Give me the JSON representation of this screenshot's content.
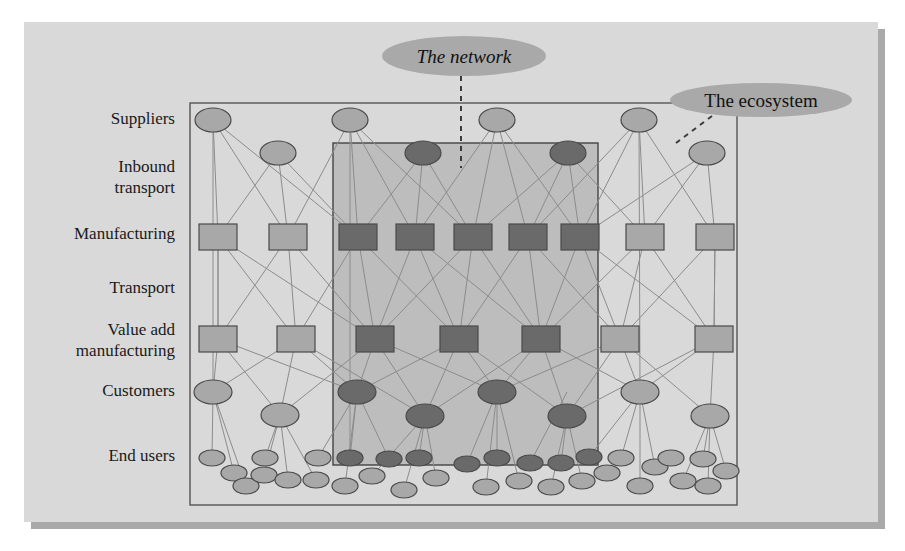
{
  "figure": {
    "kind": "network-ecosystem-diagram",
    "page_background": "#ffffff",
    "panel": {
      "x": 24,
      "y": 22,
      "w": 854,
      "h": 500,
      "fill": "#d9d9d9",
      "shadow": "#a9a9a9",
      "shadow_offset": 7
    },
    "outer_box": {
      "x": 190,
      "y": 103,
      "w": 547,
      "h": 402,
      "stroke": "#555555",
      "fill": "none",
      "label": "The ecosystem"
    },
    "inner_box": {
      "x": 333,
      "y": 143,
      "w": 265,
      "h": 322,
      "stroke": "#444444",
      "fill": "#bdbdbd",
      "label": "The network"
    }
  },
  "colors": {
    "light_node": "#a8a8a8",
    "dark_node": "#6a6a6a",
    "node_stroke": "#4a4a4a",
    "edge": "#8c8c8c",
    "callout_fill": "#a9a9a9",
    "panel_fill": "#d9d9d9",
    "inner_fill": "#bdbdbd",
    "text": "#111111"
  },
  "row_labels": [
    {
      "id": "suppliers",
      "lines": [
        "Suppliers"
      ],
      "x": 175,
      "y": 124
    },
    {
      "id": "inbound-transport",
      "lines": [
        "Inbound",
        "transport"
      ],
      "x": 175,
      "y": 172
    },
    {
      "id": "manufacturing",
      "lines": [
        "Manufacturing"
      ],
      "x": 175,
      "y": 239
    },
    {
      "id": "transport",
      "lines": [
        "Transport"
      ],
      "x": 175,
      "y": 293
    },
    {
      "id": "value-add-manufacturing",
      "lines": [
        "Value add",
        "manufacturing"
      ],
      "x": 175,
      "y": 335
    },
    {
      "id": "customers",
      "lines": [
        "Customers"
      ],
      "x": 175,
      "y": 396
    },
    {
      "id": "end-users",
      "lines": [
        "End users"
      ],
      "x": 175,
      "y": 461
    }
  ],
  "callouts": [
    {
      "id": "the-network",
      "text": "The network",
      "italic": true,
      "ellipse": {
        "cx": 464,
        "cy": 56,
        "rx": 82,
        "ry": 20
      },
      "leader": {
        "type": "dashed-vertical",
        "x1": 461,
        "y1": 76,
        "x2": 461,
        "y2": 168
      }
    },
    {
      "id": "the-ecosystem",
      "text": "The ecosystem",
      "italic": false,
      "ellipse": {
        "cx": 761,
        "cy": 100,
        "rx": 91,
        "ry": 17
      },
      "leader": {
        "type": "dashed-diagonal",
        "x1": 712,
        "y1": 116,
        "x2": 676,
        "y2": 143
      }
    }
  ],
  "rows": {
    "suppliers": {
      "shape": "ellipse",
      "rx": 18,
      "ry": 12,
      "cy": 120,
      "nodes": [
        {
          "cx": 213,
          "tone": "light"
        },
        {
          "cx": 350,
          "tone": "light"
        },
        {
          "cx": 497,
          "tone": "light"
        },
        {
          "cx": 639,
          "tone": "light"
        }
      ]
    },
    "inbound_transport": {
      "shape": "ellipse",
      "rx": 18,
      "ry": 12,
      "cy": 153,
      "nodes": [
        {
          "cx": 278,
          "tone": "light"
        },
        {
          "cx": 423,
          "tone": "dark"
        },
        {
          "cx": 568,
          "tone": "dark"
        },
        {
          "cx": 707,
          "tone": "light"
        }
      ]
    },
    "manufacturing": {
      "shape": "rect",
      "w": 38,
      "h": 26,
      "cy": 237,
      "nodes": [
        {
          "cx": 218,
          "tone": "light"
        },
        {
          "cx": 288,
          "tone": "light"
        },
        {
          "cx": 358,
          "tone": "dark"
        },
        {
          "cx": 415,
          "tone": "dark"
        },
        {
          "cx": 473,
          "tone": "dark"
        },
        {
          "cx": 528,
          "tone": "dark"
        },
        {
          "cx": 580,
          "tone": "dark"
        },
        {
          "cx": 645,
          "tone": "light"
        },
        {
          "cx": 715,
          "tone": "light"
        }
      ]
    },
    "value_add": {
      "shape": "rect",
      "w": 38,
      "h": 26,
      "cy": 339,
      "nodes": [
        {
          "cx": 218,
          "tone": "light"
        },
        {
          "cx": 296,
          "tone": "light"
        },
        {
          "cx": 375,
          "tone": "dark"
        },
        {
          "cx": 459,
          "tone": "dark"
        },
        {
          "cx": 541,
          "tone": "dark"
        },
        {
          "cx": 620,
          "tone": "light"
        },
        {
          "cx": 714,
          "tone": "light"
        }
      ]
    },
    "customers": {
      "shape": "ellipse",
      "rx": 19,
      "ry": 12,
      "nodes": [
        {
          "cx": 213,
          "cy": 392,
          "tone": "light"
        },
        {
          "cx": 280,
          "cy": 415,
          "tone": "light"
        },
        {
          "cx": 357,
          "cy": 392,
          "tone": "dark"
        },
        {
          "cx": 425,
          "cy": 416,
          "tone": "dark"
        },
        {
          "cx": 497,
          "cy": 392,
          "tone": "dark"
        },
        {
          "cx": 567,
          "cy": 416,
          "tone": "dark"
        },
        {
          "cx": 640,
          "cy": 392,
          "tone": "light"
        },
        {
          "cx": 710,
          "cy": 416,
          "tone": "light"
        }
      ]
    },
    "end_users": {
      "shape": "ellipse",
      "rx": 13,
      "ry": 8,
      "nodes": [
        {
          "cx": 212,
          "cy": 458,
          "tone": "light"
        },
        {
          "cx": 234,
          "cy": 473,
          "tone": "light"
        },
        {
          "cx": 246,
          "cy": 486,
          "tone": "light"
        },
        {
          "cx": 264,
          "cy": 475,
          "tone": "light"
        },
        {
          "cx": 265,
          "cy": 458,
          "tone": "light"
        },
        {
          "cx": 288,
          "cy": 480,
          "tone": "light"
        },
        {
          "cx": 316,
          "cy": 480,
          "tone": "light"
        },
        {
          "cx": 318,
          "cy": 458,
          "tone": "light"
        },
        {
          "cx": 345,
          "cy": 486,
          "tone": "light"
        },
        {
          "cx": 350,
          "cy": 458,
          "tone": "dark"
        },
        {
          "cx": 372,
          "cy": 476,
          "tone": "light"
        },
        {
          "cx": 389,
          "cy": 459,
          "tone": "dark"
        },
        {
          "cx": 404,
          "cy": 490,
          "tone": "light"
        },
        {
          "cx": 419,
          "cy": 458,
          "tone": "dark"
        },
        {
          "cx": 436,
          "cy": 478,
          "tone": "light"
        },
        {
          "cx": 467,
          "cy": 464,
          "tone": "dark"
        },
        {
          "cx": 486,
          "cy": 487,
          "tone": "light"
        },
        {
          "cx": 497,
          "cy": 458,
          "tone": "dark"
        },
        {
          "cx": 519,
          "cy": 481,
          "tone": "light"
        },
        {
          "cx": 530,
          "cy": 463,
          "tone": "dark"
        },
        {
          "cx": 551,
          "cy": 487,
          "tone": "light"
        },
        {
          "cx": 561,
          "cy": 463,
          "tone": "dark"
        },
        {
          "cx": 582,
          "cy": 481,
          "tone": "light"
        },
        {
          "cx": 589,
          "cy": 457,
          "tone": "dark"
        },
        {
          "cx": 607,
          "cy": 473,
          "tone": "light"
        },
        {
          "cx": 621,
          "cy": 458,
          "tone": "light"
        },
        {
          "cx": 640,
          "cy": 486,
          "tone": "light"
        },
        {
          "cx": 655,
          "cy": 467,
          "tone": "light"
        },
        {
          "cx": 671,
          "cy": 458,
          "tone": "light"
        },
        {
          "cx": 683,
          "cy": 481,
          "tone": "light"
        },
        {
          "cx": 703,
          "cy": 459,
          "tone": "light"
        },
        {
          "cx": 708,
          "cy": 486,
          "tone": "light"
        },
        {
          "cx": 726,
          "cy": 471,
          "tone": "light"
        }
      ]
    }
  },
  "edges": [
    [
      213,
      120,
      218,
      237
    ],
    [
      213,
      120,
      288,
      237
    ],
    [
      213,
      120,
      358,
      237
    ],
    [
      350,
      120,
      288,
      237
    ],
    [
      350,
      120,
      358,
      237
    ],
    [
      350,
      120,
      415,
      237
    ],
    [
      350,
      120,
      473,
      237
    ],
    [
      497,
      120,
      415,
      237
    ],
    [
      497,
      120,
      473,
      237
    ],
    [
      497,
      120,
      528,
      237
    ],
    [
      497,
      120,
      580,
      237
    ],
    [
      639,
      120,
      528,
      237
    ],
    [
      639,
      120,
      580,
      237
    ],
    [
      639,
      120,
      645,
      237
    ],
    [
      639,
      120,
      715,
      237
    ],
    [
      278,
      153,
      218,
      237
    ],
    [
      278,
      153,
      288,
      237
    ],
    [
      278,
      153,
      358,
      237
    ],
    [
      423,
      153,
      358,
      237
    ],
    [
      423,
      153,
      415,
      237
    ],
    [
      423,
      153,
      473,
      237
    ],
    [
      568,
      153,
      473,
      237
    ],
    [
      568,
      153,
      528,
      237
    ],
    [
      568,
      153,
      580,
      237
    ],
    [
      568,
      153,
      645,
      237
    ],
    [
      707,
      153,
      645,
      237
    ],
    [
      707,
      153,
      715,
      237
    ],
    [
      707,
      153,
      580,
      237
    ],
    [
      218,
      237,
      218,
      339
    ],
    [
      218,
      237,
      296,
      339
    ],
    [
      218,
      237,
      375,
      339
    ],
    [
      288,
      237,
      218,
      339
    ],
    [
      288,
      237,
      296,
      339
    ],
    [
      288,
      237,
      375,
      339
    ],
    [
      358,
      237,
      296,
      339
    ],
    [
      358,
      237,
      375,
      339
    ],
    [
      358,
      237,
      459,
      339
    ],
    [
      415,
      237,
      375,
      339
    ],
    [
      415,
      237,
      459,
      339
    ],
    [
      415,
      237,
      541,
      339
    ],
    [
      473,
      237,
      375,
      339
    ],
    [
      473,
      237,
      459,
      339
    ],
    [
      473,
      237,
      541,
      339
    ],
    [
      528,
      237,
      459,
      339
    ],
    [
      528,
      237,
      541,
      339
    ],
    [
      528,
      237,
      620,
      339
    ],
    [
      580,
      237,
      541,
      339
    ],
    [
      580,
      237,
      620,
      339
    ],
    [
      580,
      237,
      714,
      339
    ],
    [
      645,
      237,
      620,
      339
    ],
    [
      645,
      237,
      714,
      339
    ],
    [
      645,
      237,
      541,
      339
    ],
    [
      715,
      237,
      620,
      339
    ],
    [
      715,
      237,
      714,
      339
    ],
    [
      218,
      339,
      213,
      392
    ],
    [
      218,
      339,
      280,
      415
    ],
    [
      218,
      339,
      357,
      392
    ],
    [
      296,
      339,
      213,
      392
    ],
    [
      296,
      339,
      280,
      415
    ],
    [
      296,
      339,
      357,
      392
    ],
    [
      296,
      339,
      425,
      416
    ],
    [
      375,
      339,
      280,
      415
    ],
    [
      375,
      339,
      357,
      392
    ],
    [
      375,
      339,
      425,
      416
    ],
    [
      375,
      339,
      497,
      392
    ],
    [
      459,
      339,
      357,
      392
    ],
    [
      459,
      339,
      425,
      416
    ],
    [
      459,
      339,
      497,
      392
    ],
    [
      459,
      339,
      567,
      416
    ],
    [
      541,
      339,
      425,
      416
    ],
    [
      541,
      339,
      497,
      392
    ],
    [
      541,
      339,
      567,
      416
    ],
    [
      541,
      339,
      640,
      392
    ],
    [
      620,
      339,
      497,
      392
    ],
    [
      620,
      339,
      567,
      416
    ],
    [
      620,
      339,
      640,
      392
    ],
    [
      620,
      339,
      710,
      416
    ],
    [
      714,
      339,
      640,
      392
    ],
    [
      714,
      339,
      710,
      416
    ],
    [
      714,
      339,
      567,
      416
    ],
    [
      213,
      392,
      212,
      458
    ],
    [
      213,
      392,
      234,
      473
    ],
    [
      213,
      392,
      246,
      486
    ],
    [
      280,
      415,
      264,
      475
    ],
    [
      280,
      415,
      288,
      480
    ],
    [
      280,
      415,
      265,
      458
    ],
    [
      280,
      415,
      316,
      480
    ],
    [
      357,
      392,
      318,
      458
    ],
    [
      357,
      392,
      345,
      486
    ],
    [
      357,
      392,
      350,
      458
    ],
    [
      357,
      392,
      389,
      459
    ],
    [
      425,
      416,
      404,
      490
    ],
    [
      425,
      416,
      419,
      458
    ],
    [
      425,
      416,
      436,
      478
    ],
    [
      425,
      416,
      372,
      476
    ],
    [
      497,
      392,
      467,
      464
    ],
    [
      497,
      392,
      486,
      487
    ],
    [
      497,
      392,
      497,
      458
    ],
    [
      497,
      392,
      519,
      481
    ],
    [
      567,
      392,
      530,
      463
    ],
    [
      567,
      416,
      551,
      487
    ],
    [
      567,
      416,
      561,
      463
    ],
    [
      567,
      416,
      582,
      481
    ],
    [
      640,
      392,
      589,
      457
    ],
    [
      640,
      392,
      621,
      458
    ],
    [
      640,
      392,
      655,
      467
    ],
    [
      640,
      392,
      640,
      486
    ],
    [
      710,
      416,
      683,
      481
    ],
    [
      710,
      416,
      703,
      459
    ],
    [
      710,
      416,
      726,
      471
    ],
    [
      710,
      416,
      708,
      486
    ],
    [
      213,
      120,
      213,
      392
    ],
    [
      350,
      120,
      350,
      458
    ],
    [
      639,
      120,
      640,
      392
    ],
    [
      218,
      237,
      218,
      339
    ],
    [
      715,
      237,
      714,
      339
    ]
  ]
}
